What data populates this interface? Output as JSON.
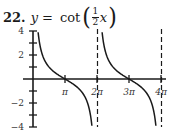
{
  "problem": {
    "number": "22.",
    "lhs": "y",
    "equals": "=",
    "function": "cot",
    "frac_num": "1",
    "frac_den": "2",
    "variable": "x",
    "open_paren": "(",
    "close_paren": ")"
  },
  "chart_data": {
    "type": "line",
    "function": "y = cot(x/2)",
    "xlabel": "",
    "ylabel": "",
    "xlim": [
      0,
      12.566
    ],
    "ylim": [
      -4,
      4
    ],
    "x_ticks": [
      {
        "value": 3.14159,
        "label": "π"
      },
      {
        "value": 6.28319,
        "label": "2π"
      },
      {
        "value": 9.42478,
        "label": "3π"
      },
      {
        "value": 12.56637,
        "label": "4π"
      }
    ],
    "y_ticks": [
      {
        "value": 4,
        "label": "4"
      },
      {
        "value": 3,
        "label": ""
      },
      {
        "value": 2,
        "label": "2"
      },
      {
        "value": 1,
        "label": ""
      },
      {
        "value": -1,
        "label": ""
      },
      {
        "value": -2,
        "label": "−2"
      },
      {
        "value": -3,
        "label": ""
      },
      {
        "value": -4,
        "label": "−4"
      }
    ],
    "asymptotes": [
      6.28319,
      12.56637
    ],
    "series": [
      {
        "name": "branch 1 (0,2π)",
        "x": [
          0.49,
          1.0,
          1.57,
          2.0,
          2.5,
          3.14,
          3.8,
          4.3,
          4.71,
          5.3,
          5.79
        ],
        "y": [
          4.0,
          1.83,
          1.0,
          0.69,
          0.32,
          0.0,
          -0.34,
          -0.71,
          -1.0,
          -1.59,
          -4.0
        ]
      },
      {
        "name": "branch 2 (2π,4π)",
        "x": [
          6.77,
          7.3,
          7.85,
          8.3,
          8.8,
          9.42,
          10.0,
          10.5,
          11.0,
          11.5,
          12.07
        ],
        "y": [
          4.0,
          1.89,
          1.0,
          0.69,
          0.32,
          0.0,
          -0.29,
          -0.56,
          -0.86,
          -1.33,
          -4.0
        ]
      }
    ],
    "grid": false,
    "legend": "none",
    "colors": {
      "curve": "#1a1a1a",
      "axes": "#1a1a1a",
      "asymptote": "#1a1a1a"
    }
  }
}
